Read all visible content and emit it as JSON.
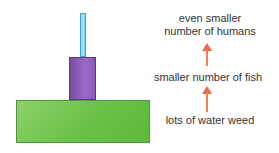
{
  "diagram": {
    "type": "pyramid-of-numbers",
    "levels": [
      {
        "name": "humans",
        "label": "even smaller number of humans",
        "label_line1": "even smaller",
        "label_line2": "number of humans",
        "color": "#aee6f8"
      },
      {
        "name": "fish",
        "label": "smaller number of fish",
        "color": "#8a5ab8"
      },
      {
        "name": "water-weed",
        "label": "lots of water weed",
        "color": "#6cc24a"
      }
    ],
    "arrow_color": "#f06a48"
  }
}
